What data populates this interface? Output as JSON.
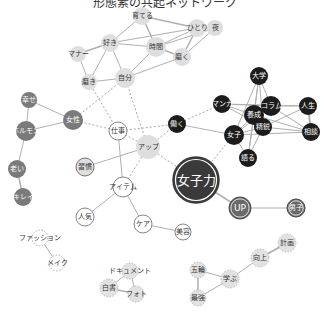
{
  "title": "形態素の共起ネットワーク",
  "colors": {
    "edge_solid": "#b0b0b0",
    "edge_dashed": "#a8a8a8",
    "node_light": "#dedede",
    "node_white": "#ffffff",
    "node_mid": "#7a7a7a",
    "node_dark": "#1c1c1c",
    "node_hub": "#3a3a3a",
    "text_dark": "#333333",
    "text_light": "#ffffff"
  },
  "nodes": [
    {
      "id": "sodateru",
      "label": "育てる",
      "x": 142,
      "y": 16,
      "r": 9,
      "style": "light"
    },
    {
      "id": "hitori",
      "label": "ひとり",
      "x": 197,
      "y": 28,
      "r": 9,
      "style": "light"
    },
    {
      "id": "yoru",
      "label": "夜",
      "x": 215,
      "y": 28,
      "r": 8,
      "style": "light"
    },
    {
      "id": "suki",
      "label": "好き",
      "x": 110,
      "y": 43,
      "r": 9,
      "style": "light"
    },
    {
      "id": "jikan",
      "label": "時間",
      "x": 156,
      "y": 47,
      "r": 10,
      "style": "light"
    },
    {
      "id": "migaku",
      "label": "磨く",
      "x": 182,
      "y": 57,
      "r": 9,
      "style": "light"
    },
    {
      "id": "manner",
      "label": "マナー",
      "x": 78,
      "y": 54,
      "r": 8,
      "style": "light"
    },
    {
      "id": "jibun",
      "label": "自分",
      "x": 125,
      "y": 78,
      "r": 10,
      "style": "light"
    },
    {
      "id": "migaki",
      "label": "磨き",
      "x": 89,
      "y": 82,
      "r": 8,
      "style": "light"
    },
    {
      "id": "shiawase",
      "label": "幸せ",
      "x": 29,
      "y": 100,
      "r": 8,
      "style": "mid"
    },
    {
      "id": "josei",
      "label": "女性",
      "x": 73,
      "y": 120,
      "r": 10,
      "style": "mid"
    },
    {
      "id": "hormone",
      "label": "ホルモン",
      "x": 26,
      "y": 131,
      "r": 10,
      "style": "mid"
    },
    {
      "id": "oi",
      "label": "老い",
      "x": 17,
      "y": 169,
      "r": 9,
      "style": "mid"
    },
    {
      "id": "kirei",
      "label": "キレイ",
      "x": 23,
      "y": 197,
      "r": 9,
      "style": "mid"
    },
    {
      "id": "shigoto",
      "label": "仕事",
      "x": 118,
      "y": 131,
      "r": 9,
      "style": "white"
    },
    {
      "id": "up_kana",
      "label": "アップ",
      "x": 148,
      "y": 147,
      "r": 12,
      "style": "light"
    },
    {
      "id": "hataraku",
      "label": "働く",
      "x": 177,
      "y": 124,
      "r": 9,
      "style": "dark"
    },
    {
      "id": "shukan",
      "label": "習慣",
      "x": 85,
      "y": 167,
      "r": 9,
      "style": "lightring"
    },
    {
      "id": "item",
      "label": "アイテム",
      "x": 123,
      "y": 187,
      "r": 10,
      "style": "white"
    },
    {
      "id": "ninki",
      "label": "人気",
      "x": 85,
      "y": 217,
      "r": 9,
      "style": "white"
    },
    {
      "id": "care",
      "label": "ケア",
      "x": 143,
      "y": 224,
      "r": 9,
      "style": "white"
    },
    {
      "id": "biyo",
      "label": "美容",
      "x": 183,
      "y": 232,
      "r": 8,
      "style": "white"
    },
    {
      "id": "joshiryoku",
      "label": "女子力",
      "x": 196,
      "y": 180,
      "r": 23,
      "style": "hub"
    },
    {
      "id": "up",
      "label": "UP",
      "x": 240,
      "y": 208,
      "r": 11,
      "style": "hubsmall"
    },
    {
      "id": "danshi",
      "label": "男子",
      "x": 296,
      "y": 208,
      "r": 9,
      "style": "hubsmall"
    },
    {
      "id": "daigaku",
      "label": "大学",
      "x": 259,
      "y": 76,
      "r": 9,
      "style": "dark"
    },
    {
      "id": "manga",
      "label": "マンガ",
      "x": 222,
      "y": 104,
      "r": 9,
      "style": "dark"
    },
    {
      "id": "column",
      "label": "コラム",
      "x": 271,
      "y": 106,
      "r": 10,
      "style": "dark"
    },
    {
      "id": "jinsei",
      "label": "人生",
      "x": 308,
      "y": 106,
      "r": 9,
      "style": "dark"
    },
    {
      "id": "yosei",
      "label": "養成",
      "x": 254,
      "y": 115,
      "r": 10,
      "style": "dark"
    },
    {
      "id": "seiei",
      "label": "精鋭",
      "x": 263,
      "y": 127,
      "r": 9,
      "style": "dark"
    },
    {
      "id": "joshi",
      "label": "女子",
      "x": 234,
      "y": 135,
      "r": 10,
      "style": "dark"
    },
    {
      "id": "sodan",
      "label": "相談",
      "x": 311,
      "y": 132,
      "r": 9,
      "style": "dark"
    },
    {
      "id": "kataru",
      "label": "語る",
      "x": 248,
      "y": 158,
      "r": 9,
      "style": "dark"
    },
    {
      "id": "fashion",
      "label": "ファッション",
      "x": 40,
      "y": 238,
      "r": 8,
      "style": "dotted"
    },
    {
      "id": "make",
      "label": "メイク",
      "x": 57,
      "y": 263,
      "r": 8,
      "style": "dotted"
    },
    {
      "id": "document",
      "label": "ドキュメント",
      "x": 130,
      "y": 271,
      "r": 8,
      "style": "lightdotted"
    },
    {
      "id": "hakusho",
      "label": "白書",
      "x": 109,
      "y": 288,
      "r": 9,
      "style": "lightdotted"
    },
    {
      "id": "photo",
      "label": "フォト",
      "x": 136,
      "y": 294,
      "r": 8,
      "style": "lightdotted"
    },
    {
      "id": "gorin",
      "label": "五輪",
      "x": 198,
      "y": 270,
      "r": 8,
      "style": "lightdotted"
    },
    {
      "id": "manabu",
      "label": "学ぶ",
      "x": 230,
      "y": 279,
      "r": 9,
      "style": "lightdotted"
    },
    {
      "id": "saikyo",
      "label": "最強",
      "x": 198,
      "y": 298,
      "r": 8,
      "style": "lightdotted"
    },
    {
      "id": "kojo",
      "label": "向上",
      "x": 260,
      "y": 258,
      "r": 9,
      "style": "lightdotted"
    },
    {
      "id": "keikaku",
      "label": "計画",
      "x": 287,
      "y": 243,
      "r": 9,
      "style": "lightdotted"
    }
  ],
  "edges": [
    {
      "a": "sodateru",
      "b": "hitori",
      "dash": false,
      "w": 1.5
    },
    {
      "a": "sodateru",
      "b": "jikan",
      "dash": false,
      "w": 1.5
    },
    {
      "a": "sodateru",
      "b": "suki",
      "dash": false,
      "w": 1
    },
    {
      "a": "hitori",
      "b": "jikan",
      "dash": false,
      "w": 1
    },
    {
      "a": "hitori",
      "b": "migaku",
      "dash": false,
      "w": 1.5
    },
    {
      "a": "hitori",
      "b": "yoru",
      "dash": false,
      "w": 1
    },
    {
      "a": "hitori",
      "b": "suki",
      "dash": false,
      "w": 1
    },
    {
      "a": "yoru",
      "b": "jikan",
      "dash": false,
      "w": 1
    },
    {
      "a": "yoru",
      "b": "migaku",
      "dash": false,
      "w": 1
    },
    {
      "a": "suki",
      "b": "jikan",
      "dash": false,
      "w": 1
    },
    {
      "a": "suki",
      "b": "manner",
      "dash": false,
      "w": 1.5
    },
    {
      "a": "suki",
      "b": "jibun",
      "dash": false,
      "w": 1
    },
    {
      "a": "suki",
      "b": "migaki",
      "dash": false,
      "w": 1
    },
    {
      "a": "jikan",
      "b": "migaku",
      "dash": false,
      "w": 1.5
    },
    {
      "a": "jikan",
      "b": "jibun",
      "dash": false,
      "w": 1
    },
    {
      "a": "migaku",
      "b": "jibun",
      "dash": false,
      "w": 1
    },
    {
      "a": "manner",
      "b": "migaki",
      "dash": false,
      "w": 1
    },
    {
      "a": "migaki",
      "b": "jibun",
      "dash": false,
      "w": 1
    },
    {
      "a": "jibun",
      "b": "josei",
      "dash": true,
      "w": 1
    },
    {
      "a": "jibun",
      "b": "up_kana",
      "dash": true,
      "w": 1
    },
    {
      "a": "migaki",
      "b": "shigoto",
      "dash": true,
      "w": 1
    },
    {
      "a": "shiawase",
      "b": "josei",
      "dash": false,
      "w": 1
    },
    {
      "a": "shiawase",
      "b": "hormone",
      "dash": false,
      "w": 1
    },
    {
      "a": "josei",
      "b": "hormone",
      "dash": false,
      "w": 1
    },
    {
      "a": "hormone",
      "b": "oi",
      "dash": false,
      "w": 1
    },
    {
      "a": "oi",
      "b": "kirei",
      "dash": false,
      "w": 1.5
    },
    {
      "a": "josei",
      "b": "shigoto",
      "dash": true,
      "w": 1
    },
    {
      "a": "shigoto",
      "b": "up_kana",
      "dash": true,
      "w": 1
    },
    {
      "a": "shigoto",
      "b": "hataraku",
      "dash": true,
      "w": 1
    },
    {
      "a": "shigoto",
      "b": "item",
      "dash": false,
      "w": 1
    },
    {
      "a": "up_kana",
      "b": "hataraku",
      "dash": true,
      "w": 1
    },
    {
      "a": "up_kana",
      "b": "shukan",
      "dash": false,
      "w": 1
    },
    {
      "a": "up_kana",
      "b": "item",
      "dash": true,
      "w": 1
    },
    {
      "a": "up_kana",
      "b": "joshiryoku",
      "dash": true,
      "w": 1
    },
    {
      "a": "hataraku",
      "b": "manga",
      "dash": true,
      "w": 1
    },
    {
      "a": "hataraku",
      "b": "joshi",
      "dash": false,
      "w": 1
    },
    {
      "a": "item",
      "b": "ninki",
      "dash": false,
      "w": 1
    },
    {
      "a": "item",
      "b": "care",
      "dash": false,
      "w": 1
    },
    {
      "a": "care",
      "b": "biyo",
      "dash": false,
      "w": 1
    },
    {
      "a": "joshiryoku",
      "b": "joshi",
      "dash": true,
      "w": 1
    },
    {
      "a": "joshiryoku",
      "b": "up",
      "dash": false,
      "w": 1.5
    },
    {
      "a": "up",
      "b": "danshi",
      "dash": false,
      "w": 1
    },
    {
      "a": "daigaku",
      "b": "yosei",
      "dash": false,
      "w": 1
    },
    {
      "a": "daigaku",
      "b": "column",
      "dash": false,
      "w": 1
    },
    {
      "a": "daigaku",
      "b": "seiei",
      "dash": false,
      "w": 1
    },
    {
      "a": "daigaku",
      "b": "joshi",
      "dash": false,
      "w": 1
    },
    {
      "a": "daigaku",
      "b": "kataru",
      "dash": false,
      "w": 1
    },
    {
      "a": "manga",
      "b": "column",
      "dash": false,
      "w": 1
    },
    {
      "a": "manga",
      "b": "yosei",
      "dash": false,
      "w": 1
    },
    {
      "a": "manga",
      "b": "seiei",
      "dash": false,
      "w": 1
    },
    {
      "a": "manga",
      "b": "jinsei",
      "dash": false,
      "w": 1
    },
    {
      "a": "column",
      "b": "jinsei",
      "dash": false,
      "w": 1
    },
    {
      "a": "column",
      "b": "yosei",
      "dash": false,
      "w": 1
    },
    {
      "a": "column",
      "b": "sodan",
      "dash": false,
      "w": 1
    },
    {
      "a": "column",
      "b": "joshi",
      "dash": false,
      "w": 1
    },
    {
      "a": "jinsei",
      "b": "sodan",
      "dash": false,
      "w": 2
    },
    {
      "a": "jinsei",
      "b": "seiei",
      "dash": false,
      "w": 1
    },
    {
      "a": "yosei",
      "b": "seiei",
      "dash": false,
      "w": 1.5
    },
    {
      "a": "yosei",
      "b": "joshi",
      "dash": false,
      "w": 1
    },
    {
      "a": "yosei",
      "b": "sodan",
      "dash": false,
      "w": 1
    },
    {
      "a": "yosei",
      "b": "kataru",
      "dash": false,
      "w": 1
    },
    {
      "a": "seiei",
      "b": "joshi",
      "dash": false,
      "w": 1
    },
    {
      "a": "seiei",
      "b": "sodan",
      "dash": false,
      "w": 1
    },
    {
      "a": "seiei",
      "b": "kataru",
      "dash": false,
      "w": 1
    },
    {
      "a": "joshi",
      "b": "kataru",
      "dash": false,
      "w": 1
    },
    {
      "a": "joshi",
      "b": "sodan",
      "dash": false,
      "w": 1
    },
    {
      "a": "fashion",
      "b": "make",
      "dash": false,
      "w": 1
    },
    {
      "a": "document",
      "b": "hakusho",
      "dash": false,
      "w": 1
    },
    {
      "a": "document",
      "b": "photo",
      "dash": false,
      "w": 1
    },
    {
      "a": "hakusho",
      "b": "photo",
      "dash": false,
      "w": 1.5
    },
    {
      "a": "gorin",
      "b": "saikyo",
      "dash": false,
      "w": 1.5
    },
    {
      "a": "gorin",
      "b": "manabu",
      "dash": false,
      "w": 1
    },
    {
      "a": "saikyo",
      "b": "manabu",
      "dash": false,
      "w": 1
    },
    {
      "a": "manabu",
      "b": "kojo",
      "dash": false,
      "w": 1
    },
    {
      "a": "kojo",
      "b": "keikaku",
      "dash": false,
      "w": 2
    }
  ]
}
